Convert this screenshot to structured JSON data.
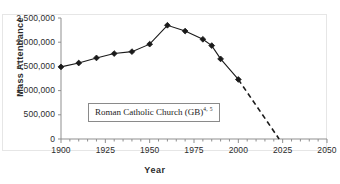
{
  "chart_data": {
    "type": "line",
    "title": "",
    "xlabel": "Year",
    "ylabel": "Mass  Attendance",
    "xlim": [
      1900,
      2050
    ],
    "ylim": [
      0,
      2500000
    ],
    "xticks": [
      1900,
      1925,
      1950,
      1975,
      2000,
      2025,
      2050
    ],
    "xtick_labels": [
      "1900",
      "1925",
      "1950",
      "1975",
      "2000",
      "2025",
      "2050"
    ],
    "x_minor_tick_interval": 5,
    "yticks": [
      0,
      500000,
      1000000,
      1500000,
      2000000,
      2500000
    ],
    "ytick_labels": [
      "0",
      "500,000",
      "1,000,000",
      "1,500,000",
      "2,000,000",
      "2,500,000"
    ],
    "grid": false,
    "legend_position": "inside-lower-left",
    "series": [
      {
        "name": "Roman Catholic Church (GB)",
        "name_superscript": "4, 5",
        "color": "#1a1a1a",
        "marker": "diamond",
        "observed_style": "solid",
        "projected_style": "dashed",
        "x": [
          1900,
          1910,
          1920,
          1930,
          1940,
          1950,
          1960,
          1970,
          1980,
          1985,
          1990,
          2000,
          2023
        ],
        "values": [
          1490000,
          1570000,
          1675000,
          1765000,
          1805000,
          1960000,
          2350000,
          2230000,
          2060000,
          1930000,
          1655000,
          1230000,
          0
        ],
        "marker_x": [
          1900,
          1910,
          1920,
          1930,
          1940,
          1950,
          1960,
          1970,
          1980,
          1985,
          1990,
          2000
        ],
        "projection_from_x": 2000,
        "projection_to_x": 2023,
        "projection_end_value": 0
      }
    ],
    "annotations": [
      {
        "text": "Roman Catholic Church (GB)",
        "superscript": "4, 5",
        "boxed": true
      }
    ]
  }
}
